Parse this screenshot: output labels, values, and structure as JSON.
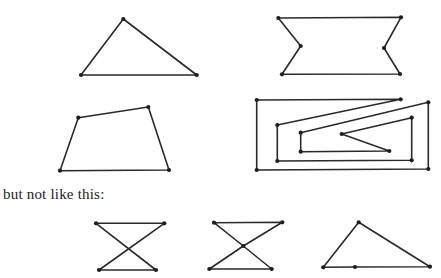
{
  "caption": "but not like this:",
  "style": {
    "stroke": "#2a2a2a",
    "dot": "#1e1e1e",
    "background": "#ffffff"
  },
  "good_polygons": [
    {
      "name": "triangle",
      "points": [
        [
          123.3,
          19
        ],
        [
          196.7,
          75
        ],
        [
          81,
          75
        ]
      ]
    },
    {
      "name": "notched-rectangle",
      "points": [
        [
          278.3,
          18
        ],
        [
          401,
          17.3
        ],
        [
          384,
          48
        ],
        [
          400,
          74
        ],
        [
          282,
          74.3
        ],
        [
          300.7,
          46
        ]
      ]
    },
    {
      "name": "quadrilateral",
      "points": [
        [
          78.3,
          117.7
        ],
        [
          148.3,
          107
        ],
        [
          169,
          170
        ],
        [
          60,
          170.7
        ]
      ]
    },
    {
      "name": "spiral-polygon",
      "points": [
        [
          256.7,
          170
        ],
        [
          256.7,
          100
        ],
        [
          400.7,
          99.3
        ],
        [
          277.3,
          125
        ],
        [
          277.3,
          161
        ],
        [
          411.7,
          160.3
        ],
        [
          411.7,
          117.7
        ],
        [
          341.7,
          134
        ],
        [
          389.3,
          151
        ],
        [
          300.7,
          151.7
        ],
        [
          300.7,
          132.7
        ],
        [
          428.3,
          102.3
        ],
        [
          428.3,
          169
        ]
      ]
    }
  ],
  "bad_polygons": [
    {
      "name": "bowtie-crossing",
      "points": [
        [
          96,
          223.3
        ],
        [
          164.3,
          223.3
        ],
        [
          99,
          270
        ],
        [
          156,
          270
        ]
      ],
      "extra_dots": []
    },
    {
      "name": "bowtie-vertex-at-crossing",
      "points": [
        [
          214,
          222.7
        ],
        [
          282.3,
          222.3
        ],
        [
          243.3,
          246
        ],
        [
          209.3,
          269
        ],
        [
          271.7,
          269
        ],
        [
          243.3,
          246
        ]
      ],
      "extra_dots": [
        [
          243.3,
          246
        ]
      ]
    },
    {
      "name": "triangle-collinear-vertex",
      "points": [
        [
          358.7,
          222.3
        ],
        [
          430,
          266.7
        ],
        [
          355,
          267
        ],
        [
          323.3,
          267.3
        ]
      ],
      "extra_dots": [
        [
          355,
          267
        ]
      ]
    }
  ]
}
